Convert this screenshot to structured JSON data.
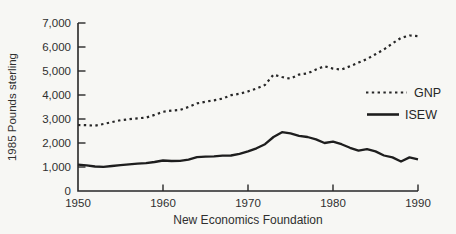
{
  "chart_data": {
    "type": "line",
    "title": "",
    "xlabel": "New Economics Foundation",
    "ylabel": "1985 Pounds sterling",
    "xlim": [
      1950,
      1990
    ],
    "ylim": [
      0,
      7000
    ],
    "x_ticks": [
      1950,
      1960,
      1970,
      1980,
      1990
    ],
    "x_tick_labels": [
      "1950",
      "1960",
      "1970",
      "1980",
      "1990"
    ],
    "y_ticks": [
      0,
      1000,
      2000,
      3000,
      4000,
      5000,
      6000,
      7000
    ],
    "y_tick_labels": [
      "0",
      "1,000",
      "2,000",
      "3,000",
      "4,000",
      "5,000",
      "6,000",
      "7,000"
    ],
    "grid": false,
    "legend_position": "right-inside",
    "ink_color": "#272727",
    "background_color": "#f7f7f4",
    "series": [
      {
        "name": "GNP",
        "line_style": "dotted",
        "color": "#272727",
        "stroke_width": 2.2,
        "x": [
          1950,
          1951,
          1952,
          1953,
          1954,
          1955,
          1956,
          1957,
          1958,
          1959,
          1960,
          1961,
          1962,
          1963,
          1964,
          1965,
          1966,
          1967,
          1968,
          1969,
          1970,
          1971,
          1972,
          1973,
          1974,
          1975,
          1976,
          1977,
          1978,
          1979,
          1980,
          1981,
          1982,
          1983,
          1984,
          1985,
          1986,
          1987,
          1988,
          1989,
          1990
        ],
        "values": [
          2750,
          2740,
          2720,
          2790,
          2870,
          2950,
          2990,
          3030,
          3060,
          3170,
          3300,
          3350,
          3380,
          3500,
          3650,
          3720,
          3780,
          3850,
          3990,
          4050,
          4150,
          4270,
          4420,
          4850,
          4750,
          4680,
          4850,
          4900,
          5060,
          5200,
          5100,
          5060,
          5200,
          5350,
          5500,
          5700,
          5900,
          6150,
          6380,
          6480,
          6450
        ]
      },
      {
        "name": "ISEW",
        "line_style": "solid",
        "color": "#1e1e1e",
        "stroke_width": 2.3,
        "x": [
          1950,
          1951,
          1952,
          1953,
          1954,
          1955,
          1956,
          1957,
          1958,
          1959,
          1960,
          1961,
          1962,
          1963,
          1964,
          1965,
          1966,
          1967,
          1968,
          1969,
          1970,
          1971,
          1972,
          1973,
          1974,
          1975,
          1976,
          1977,
          1978,
          1979,
          1980,
          1981,
          1982,
          1983,
          1984,
          1985,
          1986,
          1987,
          1988,
          1989,
          1990
        ],
        "values": [
          1100,
          1070,
          1020,
          1010,
          1040,
          1080,
          1110,
          1140,
          1160,
          1210,
          1270,
          1250,
          1260,
          1310,
          1410,
          1430,
          1440,
          1470,
          1480,
          1550,
          1650,
          1780,
          1950,
          2250,
          2450,
          2400,
          2300,
          2250,
          2150,
          2000,
          2060,
          1950,
          1800,
          1680,
          1740,
          1650,
          1480,
          1400,
          1230,
          1400,
          1320
        ]
      }
    ]
  }
}
